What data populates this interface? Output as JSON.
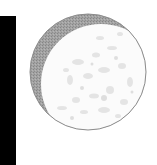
{
  "figure": {
    "phase": "waxing gibbous",
    "colors": {
      "background": "#ffffff",
      "bar": "#000000",
      "shadow": "#9c9c9c",
      "shadow_dot": "#8a8a8a",
      "lit": "#fbfbfb",
      "lit_texture": "#dedede",
      "rim": "#8c8c8c"
    },
    "moon": {
      "cx": 88,
      "cy": 72,
      "r": 58
    },
    "lit_disc": {
      "cx": 101,
      "cy": 84,
      "r": 60
    }
  }
}
